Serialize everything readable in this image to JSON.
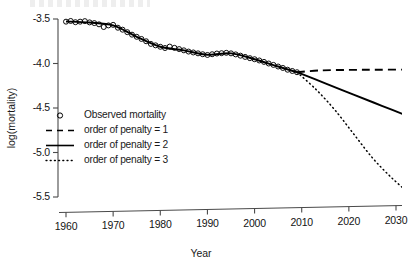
{
  "chart_data": {
    "type": "line",
    "title": "",
    "xlabel": "Year",
    "ylabel": "log(mortality)",
    "xlim": [
      1958,
      2035
    ],
    "ylim": [
      -5.62,
      -3.44
    ],
    "xticks": [
      1960,
      1970,
      1980,
      1990,
      2000,
      2010,
      2020,
      2030
    ],
    "yticks": [
      -3.5,
      -4.0,
      -4.5,
      -5.0,
      -5.5
    ],
    "ytick_labels": [
      "-3.5",
      "-4.0",
      "-4.5",
      "-5.0",
      "-5.5"
    ],
    "xtick_labels": [
      "1960",
      "1970",
      "1980",
      "1990",
      "2000",
      "2010",
      "2020",
      "2030"
    ],
    "grid": false,
    "legend_position": "center-left",
    "series": [
      {
        "name": "Observed mortality",
        "style": "points",
        "marker": "open-circle",
        "color": "#000000",
        "x": [
          1960,
          1961,
          1962,
          1963,
          1964,
          1965,
          1966,
          1967,
          1968,
          1969,
          1970,
          1971,
          1972,
          1973,
          1974,
          1975,
          1976,
          1977,
          1978,
          1979,
          1980,
          1981,
          1982,
          1983,
          1984,
          1985,
          1986,
          1987,
          1988,
          1989,
          1990,
          1991,
          1992,
          1993,
          1994,
          1995,
          1996,
          1997,
          1998,
          1999,
          2000,
          2001,
          2002,
          2003,
          2004,
          2005,
          2006,
          2007,
          2008,
          2009
        ],
        "y": [
          -3.53,
          -3.522,
          -3.536,
          -3.53,
          -3.524,
          -3.538,
          -3.546,
          -3.56,
          -3.59,
          -3.572,
          -3.566,
          -3.598,
          -3.62,
          -3.648,
          -3.676,
          -3.7,
          -3.724,
          -3.75,
          -3.78,
          -3.796,
          -3.812,
          -3.826,
          -3.81,
          -3.824,
          -3.838,
          -3.852,
          -3.866,
          -3.876,
          -3.886,
          -3.896,
          -3.904,
          -3.896,
          -3.888,
          -3.884,
          -3.88,
          -3.886,
          -3.898,
          -3.912,
          -3.926,
          -3.94,
          -3.952,
          -3.966,
          -3.982,
          -4.0,
          -4.016,
          -4.034,
          -4.05,
          -4.07,
          -4.084,
          -4.098
        ]
      },
      {
        "name": "smooth fit",
        "style": "solid-fit",
        "color": "#000000",
        "x": [
          1960,
          1965,
          1970,
          1975,
          1980,
          1985,
          1990,
          1995,
          2000,
          2005,
          2009
        ],
        "y": [
          -3.528,
          -3.54,
          -3.572,
          -3.7,
          -3.812,
          -3.852,
          -3.902,
          -3.886,
          -3.952,
          -4.034,
          -4.098
        ]
      },
      {
        "name": "order of penalty = 1",
        "style": "dashed",
        "color": "#000000",
        "x": [
          2009,
          2014,
          2020,
          2026,
          2033
        ],
        "y": [
          -4.098,
          -4.078,
          -4.072,
          -4.07,
          -4.068
        ]
      },
      {
        "name": "order of penalty = 2",
        "style": "solid",
        "color": "#000000",
        "x": [
          2009,
          2015,
          2021,
          2027,
          2033
        ],
        "y": [
          -4.098,
          -4.222,
          -4.35,
          -4.475,
          -4.6
        ]
      },
      {
        "name": "order of penalty = 3",
        "style": "dotted",
        "color": "#000000",
        "x": [
          2009,
          2013,
          2017,
          2021,
          2025,
          2029,
          2033
        ],
        "y": [
          -4.098,
          -4.29,
          -4.52,
          -4.79,
          -5.06,
          -5.28,
          -5.47
        ]
      }
    ]
  },
  "axes": {
    "y_title": "log(mortality)",
    "x_title": "Year"
  },
  "legend": {
    "entries": [
      {
        "label": "Observed mortality",
        "key": "open-circle-marker"
      },
      {
        "label": "order of penalty = 1",
        "key": "dashed-line"
      },
      {
        "label": "order of penalty = 2",
        "key": "solid-line"
      },
      {
        "label": "order of penalty = 3",
        "key": "dotted-line"
      }
    ]
  }
}
